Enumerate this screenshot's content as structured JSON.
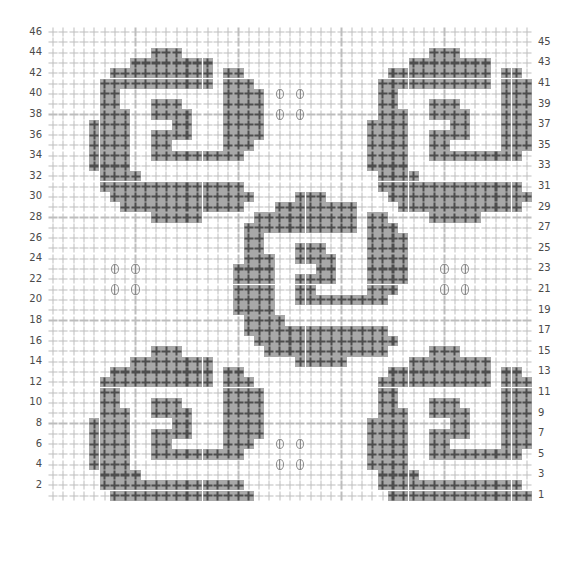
{
  "chart_data": {
    "type": "heatmap",
    "xlabel": "",
    "ylabel": "",
    "grid": true,
    "columns": 47,
    "rows": 46,
    "legend_position": "none",
    "symbols": {
      "empty_cell": "+",
      "stitch_cell": "+",
      "bead_cell": "oval-with-vertical-bar"
    },
    "colors": {
      "background": "#ffffff",
      "empty_plus": "#bdbdbd",
      "stitch_fill": "#a8a8a8",
      "stitch_plus": "#4d4d4d",
      "bead_outline": "#8a8a8a",
      "label_text": "#4a4a4a"
    },
    "axes": {
      "left_ticks": [
        46,
        44,
        42,
        40,
        38,
        36,
        34,
        32,
        30,
        28,
        26,
        24,
        22,
        20,
        18,
        16,
        14,
        12,
        10,
        8,
        6,
        4,
        2
      ],
      "right_ticks": [
        45,
        43,
        41,
        39,
        37,
        35,
        33,
        31,
        29,
        27,
        25,
        23,
        21,
        19,
        17,
        15,
        13,
        11,
        9,
        7,
        5,
        3,
        1
      ],
      "left_tick_rows": [
        0,
        2,
        4,
        6,
        8,
        10,
        12,
        14,
        16,
        18,
        20,
        22,
        24,
        26,
        28,
        30,
        32,
        34,
        36,
        38,
        40,
        42,
        44
      ],
      "right_tick_rows": [
        1,
        3,
        5,
        7,
        9,
        11,
        13,
        15,
        17,
        19,
        21,
        23,
        25,
        27,
        29,
        31,
        33,
        35,
        37,
        39,
        41,
        43,
        45
      ]
    },
    "motif": {
      "name": "rose-motif",
      "width": 17,
      "height": 17,
      "origins": [
        [
          4,
          2
        ],
        [
          31,
          2
        ],
        [
          18,
          16
        ],
        [
          4,
          31
        ],
        [
          31,
          31
        ]
      ],
      "rows": [
        "00000011100000000",
        "00001111111100000",
        "00111111111101100",
        "01111111111101110",
        "01100000000001111",
        "01100011100001111",
        "01110011110001111",
        "11110000110001111",
        "11110011110001111",
        "11110011000001110",
        "11110011111111100",
        "11110000000000000",
        "01111000000000000",
        "01111111111111100",
        "00111111111111110",
        "00011111111111100",
        "00000011111000000"
      ]
    },
    "beads": {
      "name": "bead-cluster",
      "cluster_offsets": [
        [
          0,
          0
        ],
        [
          2,
          0
        ],
        [
          0,
          2
        ],
        [
          2,
          2
        ]
      ],
      "cluster_origins": [
        [
          22,
          6
        ],
        [
          6,
          23
        ],
        [
          38,
          23
        ],
        [
          22,
          40
        ]
      ]
    }
  }
}
